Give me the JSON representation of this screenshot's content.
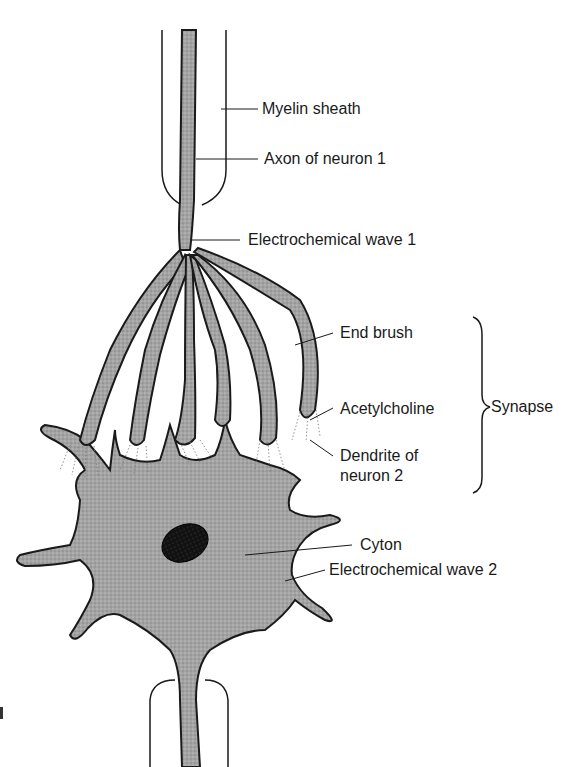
{
  "diagram": {
    "type": "neuron-synapse-illustration",
    "colors": {
      "cell_fill": "#9a9a9a",
      "outline": "#1a1a1a",
      "nucleus": "#141414",
      "background": "#ffffff",
      "synaptic_gap_stipple": "#777777"
    },
    "labels": {
      "myelin_sheath": "Myelin sheath",
      "axon_neuron_1": "Axon of neuron 1",
      "wave_1": "Electrochemical wave 1",
      "end_brush": "End brush",
      "acetylcholine": "Acetylcholine",
      "dendrite_neuron_2": "Dendrite of\nneuron 2",
      "synapse": "Synapse",
      "cyton": "Cyton",
      "wave_2": "Electrochemical wave 2"
    },
    "components": [
      "myelin-sheath-top",
      "axon-neuron-1",
      "end-brush-branches",
      "acetylcholine-release-zones",
      "dendrites-neuron-2",
      "cyton-cell-body",
      "nucleus",
      "axon-neuron-2",
      "myelin-sheath-bottom",
      "synapse-bracket"
    ]
  }
}
